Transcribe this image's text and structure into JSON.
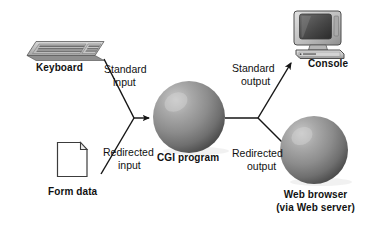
{
  "diagram": {
    "background_color": "#ffffff",
    "text_color": "#111111",
    "line_color": "#1a1a1a",
    "nodes": [
      {
        "id": "keyboard",
        "label": "Keyboard",
        "icon": "keyboard-icon",
        "type": "device"
      },
      {
        "id": "form-data",
        "label": "Form data",
        "icon": "document-icon",
        "type": "document"
      },
      {
        "id": "cgi-program",
        "label": "CGI program",
        "icon": "sphere-icon",
        "type": "process"
      },
      {
        "id": "console",
        "label": "Console",
        "icon": "computer-monitor-icon",
        "type": "device"
      },
      {
        "id": "web-browser",
        "label_line1": "Web browser",
        "label_line2": "(via Web server)",
        "icon": "sphere-icon",
        "type": "process"
      }
    ],
    "edges": [
      {
        "id": "standard-input",
        "label_line1": "Standard",
        "label_line2": "input",
        "from": "keyboard",
        "to": "cgi-program"
      },
      {
        "id": "redirected-input",
        "label_line1": "Redirected",
        "label_line2": "input",
        "from": "form-data",
        "to": "cgi-program"
      },
      {
        "id": "standard-output",
        "label_line1": "Standard",
        "label_line2": "output",
        "from": "cgi-program",
        "to": "console"
      },
      {
        "id": "redirected-output",
        "label_line1": "Redirected",
        "label_line2": "output",
        "from": "cgi-program",
        "to": "web-browser"
      }
    ]
  }
}
